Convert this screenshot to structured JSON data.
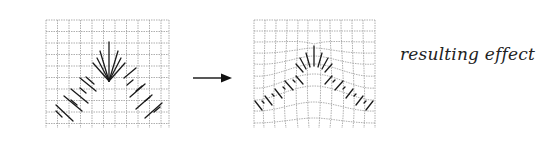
{
  "figure": {
    "left_panel": {
      "label": "original grid with hair strands"
    },
    "arrow": {
      "direction": "right"
    },
    "right_panel": {
      "label": "warped grid with hair strands"
    },
    "caption": "resulting effect"
  },
  "colors": {
    "grid": "#9a9a9a",
    "strokes": "#1a1a1a",
    "background": "#ffffff"
  }
}
